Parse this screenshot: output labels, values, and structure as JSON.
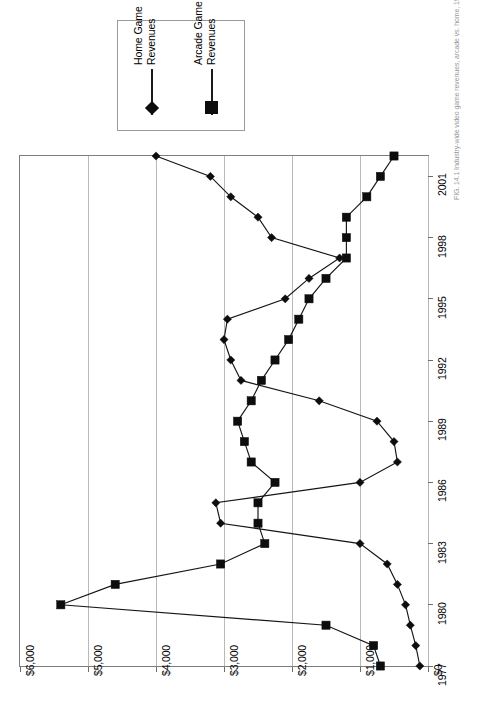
{
  "figure": {
    "orientation": "rotated-90-ccw",
    "caption": "FIG. 14.1   Industry-wide video game revenues, arcade vs. home, 1977-2002"
  },
  "legend": {
    "position": "top-left",
    "entries": [
      {
        "label": "Home Game\nRevenues",
        "marker": "diamond",
        "color": "#0d0d0d"
      },
      {
        "label": "Arcade Game\nRevenues",
        "marker": "square",
        "color": "#0d0d0d"
      }
    ]
  },
  "axes": {
    "value_axis": {
      "ticks": [
        "$6,000",
        "$5,000",
        "$4,000",
        "$3,000",
        "$2,000",
        "$1,000",
        "$0"
      ],
      "values": [
        6000,
        5000,
        4000,
        3000,
        2000,
        1000,
        0
      ],
      "min": 0,
      "max": 6000,
      "grid": true
    },
    "year_axis": {
      "ticks": [
        "2001",
        "1998",
        "1995",
        "1992",
        "1989",
        "1986",
        "1983",
        "1980",
        "1977"
      ],
      "values": [
        2001,
        1998,
        1995,
        1992,
        1989,
        1986,
        1983,
        1980,
        1977
      ],
      "min": 1977,
      "max": 2002,
      "grid": false
    }
  },
  "chart_data": {
    "type": "line",
    "title": "",
    "subtitle": "",
    "xlabel": "",
    "ylabel": "",
    "orientation": "rotated",
    "grid": true,
    "legend_position": "top-left",
    "xlim": [
      1977,
      2002
    ],
    "ylim": [
      0,
      6000
    ],
    "x": [
      1977,
      1978,
      1979,
      1980,
      1981,
      1982,
      1983,
      1984,
      1985,
      1986,
      1987,
      1988,
      1989,
      1990,
      1991,
      1992,
      1993,
      1994,
      1995,
      1996,
      1997,
      1998,
      1999,
      2000,
      2001,
      2002
    ],
    "categories": [
      "1977",
      "1978",
      "1979",
      "1980",
      "1981",
      "1982",
      "1983",
      "1984",
      "1985",
      "1986",
      "1987",
      "1988",
      "1989",
      "1990",
      "1991",
      "1992",
      "1993",
      "1994",
      "1995",
      "1996",
      "1997",
      "1998",
      "1999",
      "2000",
      "2001",
      "2002"
    ],
    "series": [
      {
        "name": "Home Game Revenues",
        "marker": "diamond",
        "color": "#0d0d0d",
        "values": [
          120,
          180,
          260,
          330,
          450,
          600,
          1000,
          3050,
          3120,
          1000,
          450,
          500,
          750,
          1600,
          2750,
          2900,
          3000,
          2950,
          2100,
          1750,
          1300,
          2300,
          2500,
          2900,
          3200,
          4000
        ]
      },
      {
        "name": "Arcade Game Revenues",
        "marker": "square",
        "color": "#0d0d0d",
        "values": [
          700,
          800,
          1500,
          5400,
          4600,
          3050,
          2400,
          2500,
          2500,
          2250,
          2600,
          2700,
          2800,
          2600,
          2450,
          2250,
          2050,
          1900,
          1750,
          1500,
          1200,
          1200,
          1200,
          900,
          700,
          500
        ]
      }
    ],
    "units": "millions of dollars",
    "value_prefix": "$"
  }
}
